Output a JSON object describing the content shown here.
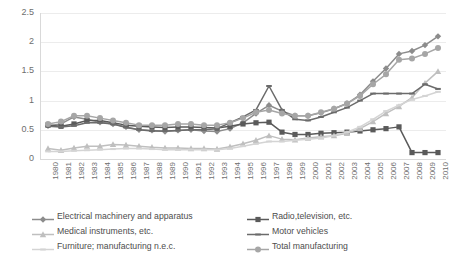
{
  "chart_data": {
    "type": "line",
    "title": "",
    "xlabel": "",
    "ylabel": "",
    "ylim": [
      0,
      2.5
    ],
    "yticks": [
      "0",
      "0.5",
      "1",
      "1.5",
      "2",
      "2.5"
    ],
    "ytick_values": [
      0,
      0.5,
      1,
      1.5,
      2,
      2.5
    ],
    "grid": true,
    "legend_position": "bottom",
    "categories": [
      "1980",
      "1981",
      "1982",
      "1983",
      "1984",
      "1985",
      "1986",
      "1987",
      "1988",
      "1989",
      "1990",
      "1991",
      "1992",
      "1993",
      "1994",
      "1995",
      "1996",
      "1997",
      "1998",
      "1999",
      "2000",
      "2001",
      "2002",
      "2003",
      "2004",
      "2005",
      "2006",
      "2007",
      "2008",
      "2009",
      "2010"
    ],
    "series": [
      {
        "name": "Electrical machinery and apparatus",
        "color": "#8c8c8c",
        "marker": "diamond",
        "values": [
          0.57,
          0.6,
          0.72,
          0.68,
          0.63,
          0.6,
          0.55,
          0.5,
          0.49,
          0.47,
          0.49,
          0.5,
          0.48,
          0.47,
          0.52,
          0.62,
          0.78,
          0.92,
          0.82,
          0.74,
          0.74,
          0.79,
          0.86,
          0.95,
          1.1,
          1.33,
          1.55,
          1.8,
          1.85,
          1.95,
          2.1
        ]
      },
      {
        "name": "Radio,television, etc.",
        "color": "#5a5a5a",
        "marker": "square",
        "values": [
          0.58,
          0.56,
          0.6,
          0.66,
          0.66,
          0.62,
          0.58,
          0.56,
          0.55,
          0.54,
          0.55,
          0.55,
          0.54,
          0.53,
          0.56,
          0.6,
          0.62,
          0.63,
          0.46,
          0.42,
          0.42,
          0.44,
          0.45,
          0.46,
          0.48,
          0.5,
          0.52,
          0.55,
          0.11,
          0.11,
          0.11
        ]
      },
      {
        "name": "Medical instruments, etc.",
        "color": "#bfbfbf",
        "marker": "triangle",
        "values": [
          0.18,
          0.15,
          0.19,
          0.22,
          0.22,
          0.25,
          0.24,
          0.22,
          0.2,
          0.19,
          0.19,
          0.18,
          0.18,
          0.17,
          0.21,
          0.26,
          0.32,
          0.4,
          0.34,
          0.33,
          0.36,
          0.38,
          0.4,
          0.44,
          0.52,
          0.64,
          0.78,
          0.9,
          1.05,
          1.3,
          1.5
        ]
      },
      {
        "name": "Motor vehicles",
        "color": "#6b6b6b",
        "marker": "line",
        "values": [
          0.56,
          0.55,
          0.57,
          0.62,
          0.62,
          0.6,
          0.54,
          0.5,
          0.48,
          0.48,
          0.49,
          0.5,
          0.5,
          0.52,
          0.62,
          0.72,
          0.84,
          1.25,
          0.84,
          0.68,
          0.66,
          0.72,
          0.8,
          0.88,
          1.0,
          1.12,
          1.12,
          1.12,
          1.12,
          1.28,
          1.2
        ]
      },
      {
        "name": "Furniture; manufacturing n.e.c.",
        "color": "#d4d4d4",
        "marker": "line",
        "values": [
          0.13,
          0.13,
          0.14,
          0.15,
          0.16,
          0.17,
          0.18,
          0.18,
          0.17,
          0.16,
          0.16,
          0.16,
          0.16,
          0.16,
          0.18,
          0.22,
          0.26,
          0.3,
          0.3,
          0.32,
          0.34,
          0.36,
          0.4,
          0.46,
          0.55,
          0.68,
          0.82,
          0.92,
          1.02,
          1.08,
          1.15
        ]
      },
      {
        "name": "Total manufacturing",
        "color": "#a6a6a6",
        "marker": "circle",
        "values": [
          0.6,
          0.64,
          0.74,
          0.74,
          0.7,
          0.66,
          0.62,
          0.58,
          0.58,
          0.58,
          0.6,
          0.6,
          0.58,
          0.58,
          0.62,
          0.7,
          0.8,
          0.84,
          0.78,
          0.74,
          0.74,
          0.8,
          0.86,
          0.95,
          1.08,
          1.28,
          1.45,
          1.7,
          1.72,
          1.8,
          1.9
        ]
      }
    ]
  },
  "legend": {
    "items": [
      {
        "label": "Electrical machinery and apparatus"
      },
      {
        "label": "Radio,television, etc."
      },
      {
        "label": "Medical instruments, etc."
      },
      {
        "label": "Motor vehicles"
      },
      {
        "label": "Furniture; manufacturing n.e.c."
      },
      {
        "label": "Total manufacturing"
      }
    ]
  }
}
